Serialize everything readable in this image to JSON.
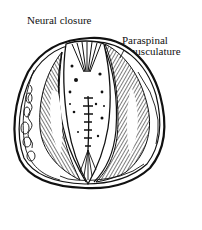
{
  "figure": {
    "labels": {
      "neural_closure": "Neural closure",
      "paraspinal_line1": "Paraspinal",
      "paraspinal_line2": "/ musculature"
    }
  },
  "colors": {
    "ink": "#111111",
    "background": "#ffffff"
  }
}
